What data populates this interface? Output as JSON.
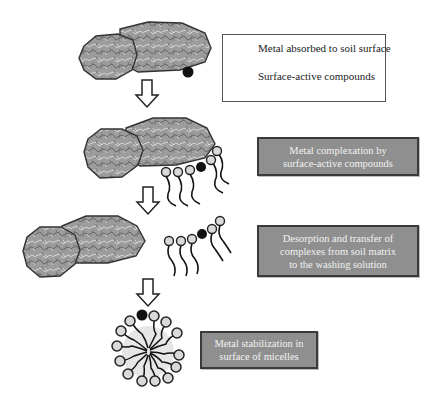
{
  "legend": {
    "metal_label": "Metal absorbed to soil surface",
    "surfactant_label": "Surface-active compounds"
  },
  "steps": [
    {
      "id": "complexation",
      "lines": [
        "Metal complexation by",
        "surface-active compounds"
      ]
    },
    {
      "id": "desorption",
      "lines": [
        "Desorption and transfer of",
        "complexes from soil matrix",
        "to the washing solution"
      ]
    },
    {
      "id": "stabilization",
      "lines": [
        "Metal stabilization in",
        "surface of micelles"
      ]
    }
  ],
  "colors": {
    "soil_fill": "#9a9a9a",
    "soil_outline": "#333333",
    "metal": "#111111",
    "surfactant_head": "#d9d9d9",
    "step_box_fill": "#8f8f8f",
    "step_box_border": "#3a3a3a",
    "step_text": "#f2f2f2"
  }
}
